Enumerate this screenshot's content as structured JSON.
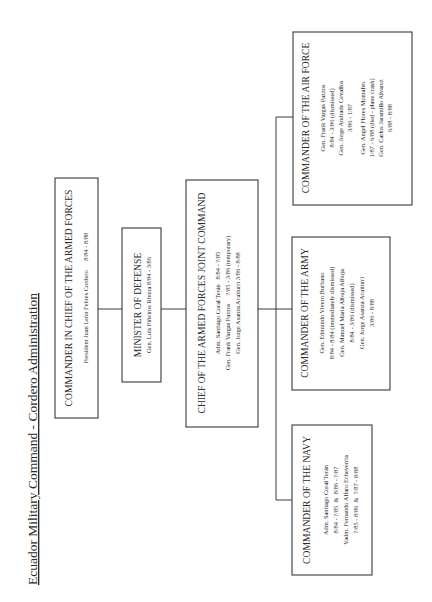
{
  "title": "Ecuador Military Command - Cordero Administration",
  "nodes": {
    "commander_in_chief": {
      "heading": "COMMANDER IN CHIEF OF THE ARMED FORCES",
      "lines": [
        "President Juan León Febres Cordero      8/84 - 8/88"
      ]
    },
    "minister_of_defense": {
      "heading": "MINISTER OF DEFENSE",
      "lines": [
        "Gen. Luis Piñeiros Rivera  8/84 - 3/86"
      ]
    },
    "joint_command": {
      "heading": "CHIEF OF THE ARMED FORCES JOINT COMMAND",
      "lines": [
        "Adm. Santiago Coral Terán   8/84 - ?/85",
        "Gen. Frank Vargas Pazzos     ?/85 - 3/86 (temporary)",
        "Gen. Jorge Asanza Acaiturri 3/86 - 8/88"
      ]
    },
    "navy": {
      "heading": "COMMANDER OF THE NAVY",
      "lines": [
        "Adm. Santiago Coral Terán",
        "8/84 - ?/85  &  8/86 - ?/87",
        "Vadm. Fernando Alfaro Echeverría",
        "?/85 - 8/86  &  ?/87 - 8/88"
      ]
    },
    "army": {
      "heading": "COMMANDER OF THE ARMY",
      "lines": [
        "Gen. Edmundo Vivero Burbano",
        "8/84 - 8/84 (immediately dismissed)",
        "Gen. Manuel María Albuja Albuja",
        "8/84 - 3/86 (dismissed)",
        "Gen. Jorge Asanza Acaiturri",
        "3/86 - 8/88"
      ]
    },
    "air_force": {
      "heading": "COMMANDER OF THE AIR FORCE",
      "lines": [
        "Gen. Frank Vargas Pazzos",
        "8/84 - 3/86 (dismissed)",
        "Gen. Jorge Andrade Cevallos",
        "3/86 - 1/87",
        "Gen. Angel Flores Montalvo",
        "1/87 - 6/88 (died - plane crash)",
        "Gen. Carlos Jaramillo Alvarez",
        "6/88 - 8/88"
      ]
    }
  }
}
